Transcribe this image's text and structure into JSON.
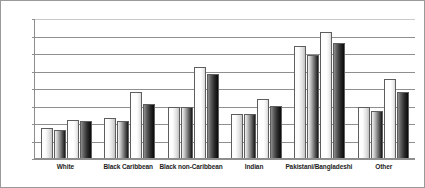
{
  "chart_data": {
    "type": "bar",
    "title": "",
    "subtitle": "",
    "xlabel": "",
    "ylabel": "",
    "ylim": [
      0,
      80
    ],
    "ytick_step": 10,
    "yticks": [
      0,
      10,
      20,
      30,
      40,
      50,
      60,
      70,
      80
    ],
    "ytick_labels": [
      "0",
      "10",
      "20",
      "30",
      "40",
      "50",
      "60",
      "70",
      "80"
    ],
    "grid": true,
    "grid_axis": "y",
    "legend": false,
    "legend_position": "none",
    "categories": [
      "White",
      "Black Caribbean",
      "Black non-Caribbean",
      "Indian",
      "Pakistani/Bangladeshi",
      "Other"
    ],
    "series": [
      {
        "name": "Series 1",
        "fill": "light-gradient",
        "values": [
          17,
          23,
          29,
          25,
          64,
          29
        ]
      },
      {
        "name": "Series 2",
        "fill": "mid-gradient",
        "values": [
          16,
          21,
          29,
          25,
          59,
          27
        ]
      },
      {
        "name": "Series 3",
        "fill": "white",
        "values": [
          22,
          38,
          52,
          34,
          72,
          45
        ]
      },
      {
        "name": "Series 4",
        "fill": "dark-gradient",
        "values": [
          21,
          31,
          48,
          30,
          66,
          38
        ]
      }
    ]
  },
  "style": {
    "background": "#ffffff",
    "border_color": "#9a9a9a",
    "axis_color": "#8d8d8d",
    "gridline_color": "#8f8f8f",
    "bar_outline": "#5e5e5e",
    "text_color": "#1d1d1d"
  }
}
